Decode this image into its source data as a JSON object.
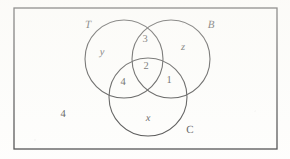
{
  "figure": {
    "type": "venn-diagram",
    "background_color": "#fdfdfb",
    "stroke_color": "#1a1a1a",
    "text_color": "#1a1a1a"
  },
  "universe": {
    "shape": "rectangle",
    "x": 14,
    "y": 8,
    "width": 263,
    "height": 141,
    "outside_label": "4"
  },
  "sets": [
    {
      "id": "T",
      "label": "T",
      "style": "italic",
      "cx": 124,
      "cy": 59,
      "r": 39,
      "label_x": 88,
      "label_y": 25
    },
    {
      "id": "B",
      "label": "B",
      "style": "italic",
      "cx": 171,
      "cy": 59,
      "r": 39,
      "label_x": 211,
      "label_y": 25
    },
    {
      "id": "C",
      "label": "C",
      "style": "upright",
      "cx": 148,
      "cy": 97,
      "r": 39,
      "label_x": 190,
      "label_y": 130
    }
  ],
  "regions": [
    {
      "id": "T-only",
      "value": "y",
      "style": "italic",
      "x": 102,
      "y": 53
    },
    {
      "id": "B-only",
      "value": "z",
      "style": "italic",
      "x": 183,
      "y": 48
    },
    {
      "id": "C-only",
      "value": "x",
      "style": "italic",
      "x": 148,
      "y": 119
    },
    {
      "id": "T-and-B",
      "value": "3",
      "style": "numeral",
      "x": 145,
      "y": 40
    },
    {
      "id": "T-and-C",
      "value": "4",
      "style": "numeral",
      "x": 123,
      "y": 83
    },
    {
      "id": "B-and-C",
      "value": "1",
      "style": "numeral",
      "x": 169,
      "y": 81
    },
    {
      "id": "T-B-and-C",
      "value": "2",
      "style": "numeral",
      "x": 146,
      "y": 67
    },
    {
      "id": "outside",
      "value": "4",
      "style": "numeral",
      "x": 63,
      "y": 115
    }
  ]
}
